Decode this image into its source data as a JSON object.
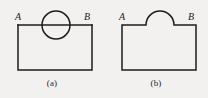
{
  "plate": {
    "width": 208,
    "height": 98,
    "background_color": "#f2f1ef",
    "ink_color": "#1c1c1c",
    "description": "Two line-drawing diagrams of a rectangle with a circular feature on its top edge"
  },
  "panels": [
    {
      "id": "a",
      "caption": "(a)",
      "labels": {
        "left": "A",
        "right": "B"
      },
      "geometry": {
        "shape": "rectangle-with-full-circle-on-top-edge",
        "rect": {
          "x": 18,
          "y": 25,
          "width": 74,
          "height": 45
        },
        "circle": {
          "cx": 56,
          "cy": 25,
          "r": 14
        },
        "top_edge_passes_through_circle": true
      }
    },
    {
      "id": "b",
      "caption": "(b)",
      "labels": {
        "left": "A",
        "right": "B"
      },
      "geometry": {
        "shape": "rectangle-with-semicircular-bump-on-top-edge",
        "rect": {
          "x": 18,
          "y": 25,
          "width": 74,
          "height": 45
        },
        "arc": {
          "cx": 56,
          "cy": 25,
          "r": 14,
          "half": "upper"
        },
        "top_edge_has_gap_under_arc": true
      }
    }
  ]
}
